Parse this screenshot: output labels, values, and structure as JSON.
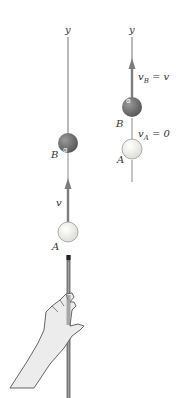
{
  "figure": {
    "left_panel": {
      "axis_label": "y",
      "ball_b_label": "B",
      "ball_a_label": "A",
      "velocity_label": "v"
    },
    "right_panel": {
      "axis_label": "y",
      "ball_b_label": "B",
      "ball_a_label": "A",
      "velocity_b_main": "v",
      "velocity_b_sub": "B",
      "velocity_b_rhs": " = v",
      "velocity_a_main": "v",
      "velocity_a_sub": "A",
      "velocity_a_rhs": " = 0"
    },
    "colors": {
      "axis": "#8a8a8a",
      "arrow": "#7d7d7d",
      "ball_b": "#6f6f6f",
      "ball_a": "#f4f4f0",
      "cue": "#7a7a7a",
      "hand_fill": "#ececec",
      "hand_stroke": "#555555"
    }
  }
}
